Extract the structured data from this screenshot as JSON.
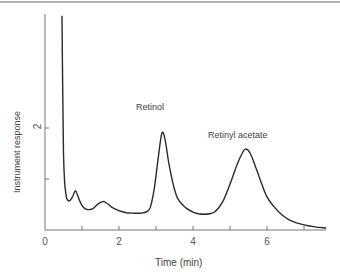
{
  "chart_data": {
    "type": "line",
    "title": "",
    "xlabel": "Time (min)",
    "ylabel": "Instrument response",
    "xlim": [
      0,
      7.6
    ],
    "ylim": [
      0,
      4.2
    ],
    "x_ticks": [
      0,
      1,
      2,
      3,
      4,
      5,
      6,
      7
    ],
    "x_tick_labels": [
      "0",
      "",
      "2",
      "",
      "4",
      "",
      "6",
      ""
    ],
    "y_ticks": [
      1,
      2
    ],
    "y_tick_labels": [
      "",
      "2"
    ],
    "grid": false,
    "legend": null,
    "series": [
      {
        "name": "Chromatogram",
        "x": [
          0.46,
          0.48,
          0.5,
          0.53,
          0.57,
          0.6,
          0.64,
          0.68,
          0.75,
          0.82,
          0.88,
          0.95,
          1.02,
          1.1,
          1.2,
          1.3,
          1.42,
          1.57,
          1.7,
          1.8,
          2.0,
          2.2,
          2.4,
          2.6,
          2.75,
          2.85,
          2.95,
          3.05,
          3.16,
          3.25,
          3.35,
          3.48,
          3.6,
          3.8,
          4.0,
          4.15,
          4.3,
          4.45,
          4.6,
          4.8,
          5.0,
          5.2,
          5.35,
          5.43,
          5.55,
          5.7,
          5.85,
          6.0,
          6.2,
          6.4,
          6.6,
          6.8,
          7.0,
          7.3,
          7.6
        ],
        "y": [
          4.2,
          2.6,
          1.5,
          0.95,
          0.68,
          0.6,
          0.57,
          0.58,
          0.66,
          0.77,
          0.68,
          0.55,
          0.46,
          0.41,
          0.4,
          0.42,
          0.5,
          0.56,
          0.51,
          0.45,
          0.38,
          0.34,
          0.33,
          0.33,
          0.36,
          0.45,
          0.8,
          1.35,
          1.9,
          1.75,
          1.3,
          0.85,
          0.6,
          0.44,
          0.35,
          0.32,
          0.31,
          0.32,
          0.36,
          0.55,
          0.9,
          1.3,
          1.53,
          1.59,
          1.5,
          1.22,
          0.92,
          0.65,
          0.45,
          0.3,
          0.2,
          0.14,
          0.1,
          0.06,
          0.04
        ]
      }
    ],
    "annotations": [
      {
        "text": "Retinol",
        "x": 3.16,
        "y": 2.4,
        "peak_time": 3.16,
        "peak_response": 1.9
      },
      {
        "text": "Retinyl acetate",
        "x": 5.43,
        "y": 1.85,
        "peak_time": 5.43,
        "peak_response": 1.59
      }
    ]
  },
  "labels": {
    "xlabel": "Time (min)",
    "ylabel": "Instrument response",
    "xticks": {
      "t0": "0",
      "t2": "2",
      "t4": "4",
      "t6": "6"
    },
    "yticks": {
      "t2": "2"
    },
    "peak_retinol": "Retinol",
    "peak_retinyl_acetate": "Retinyl acetate"
  },
  "style": {
    "line_color": "#2a2a2a",
    "axis_color": "#777777",
    "top_rule_color": "#666666"
  }
}
